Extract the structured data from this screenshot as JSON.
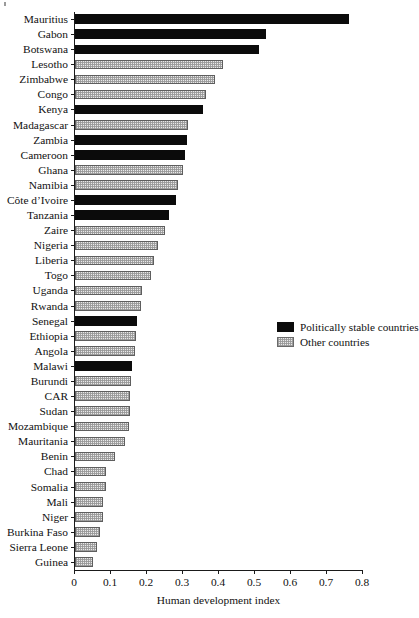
{
  "chart_data": {
    "type": "bar",
    "orientation": "horizontal",
    "title": "",
    "xlabel": "Human development index",
    "ylabel": "",
    "xlim": [
      0,
      0.8
    ],
    "xticks": [
      "0",
      "0.1",
      "0.2",
      "0.3",
      "0.4",
      "0.5",
      "0.6",
      "0.7",
      "0.8"
    ],
    "xtick_values": [
      0,
      0.1,
      0.2,
      0.3,
      0.4,
      0.5,
      0.6,
      0.7,
      0.8
    ],
    "grid": false,
    "legend_position": "middle-right",
    "legend": [
      {
        "label": "Politically stable countries",
        "group": "stable",
        "color": "#0b0b0b"
      },
      {
        "label": "Other countries",
        "group": "other",
        "color": "#d8d8d8"
      }
    ],
    "categories": [
      "Mauritius",
      "Gabon",
      "Botswana",
      "Lesotho",
      "Zimbabwe",
      "Congo",
      "Kenya",
      "Madagascar",
      "Zambia",
      "Cameroon",
      "Ghana",
      "Namibia",
      "Côte d’Ivoire",
      "Tanzania",
      "Zaire",
      "Nigeria",
      "Liberia",
      "Togo",
      "Uganda",
      "Rwanda",
      "Senegal",
      "Ethiopia",
      "Angola",
      "Malawi",
      "Burundi",
      "CAR",
      "Sudan",
      "Mozambique",
      "Mauritania",
      "Benin",
      "Chad",
      "Somalia",
      "Mali",
      "Niger",
      "Burkina Faso",
      "Sierra Leone",
      "Guinea"
    ],
    "values": [
      0.76,
      0.53,
      0.51,
      0.41,
      0.39,
      0.365,
      0.355,
      0.315,
      0.31,
      0.305,
      0.3,
      0.285,
      0.28,
      0.26,
      0.25,
      0.23,
      0.22,
      0.21,
      0.185,
      0.182,
      0.172,
      0.17,
      0.166,
      0.158,
      0.155,
      0.153,
      0.152,
      0.15,
      0.139,
      0.111,
      0.086,
      0.086,
      0.078,
      0.078,
      0.07,
      0.061,
      0.05
    ],
    "groups": [
      "stable",
      "stable",
      "stable",
      "other",
      "other",
      "other",
      "stable",
      "other",
      "stable",
      "stable",
      "other",
      "other",
      "stable",
      "stable",
      "other",
      "other",
      "other",
      "other",
      "other",
      "other",
      "stable",
      "other",
      "other",
      "stable",
      "other",
      "other",
      "other",
      "other",
      "other",
      "other",
      "other",
      "other",
      "other",
      "other",
      "other",
      "other",
      "other"
    ]
  }
}
